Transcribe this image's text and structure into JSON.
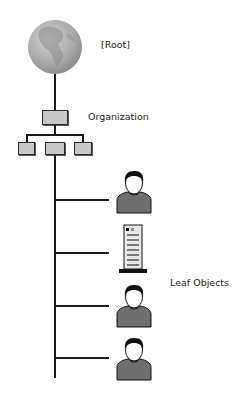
{
  "diagram": {
    "root": {
      "label": "[Root]",
      "icon": "globe-icon"
    },
    "organization": {
      "label": "Organization",
      "icon": "org-box-icon",
      "children_count": 3
    },
    "leaf_group": {
      "label": "Leaf Objects",
      "items": [
        {
          "icon": "user-icon"
        },
        {
          "icon": "server-icon"
        },
        {
          "icon": "user-icon"
        },
        {
          "icon": "user-icon"
        }
      ]
    }
  },
  "colors": {
    "line": "#1a1a1a",
    "box_fill": "#c8c8c8",
    "globe": "#a8a8a8",
    "user_body": "#6e6e6e"
  }
}
